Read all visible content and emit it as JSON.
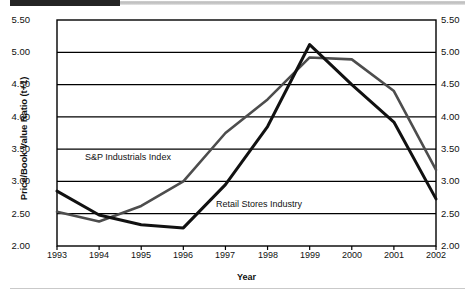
{
  "chart_data": {
    "type": "line",
    "title": "",
    "xlabel": "Year",
    "ylabel": "Price/Book Value Ratio (t+1)",
    "categories": [
      "1993",
      "1994",
      "1995",
      "1996",
      "1997",
      "1998",
      "1999",
      "2000",
      "2001",
      "2002"
    ],
    "x": [
      1993,
      1994,
      1995,
      1996,
      1997,
      1998,
      1999,
      2000,
      2001,
      2002
    ],
    "ylim": [
      2.0,
      5.5
    ],
    "xlim": [
      1993,
      2002
    ],
    "yticks": [
      "2.00",
      "2.50",
      "3.00",
      "3.50",
      "4.00",
      "4.50",
      "5.00",
      "5.50"
    ],
    "ytick_values": [
      2.0,
      2.5,
      3.0,
      3.5,
      4.0,
      4.5,
      5.0,
      5.5
    ],
    "grid": "horizontal",
    "legend_position": "inline-annotation",
    "dual_y_axis": true,
    "series": [
      {
        "name": "S&P Industrials Index",
        "color": "#4d4d4d",
        "values": [
          2.53,
          2.38,
          2.62,
          3.0,
          3.75,
          4.27,
          4.92,
          4.89,
          4.4,
          3.18
        ]
      },
      {
        "name": "Retail Stores Industry",
        "color": "#111111",
        "values": [
          2.85,
          2.48,
          2.33,
          2.28,
          2.95,
          3.85,
          5.12,
          4.5,
          3.92,
          2.73
        ]
      }
    ],
    "annotations": [
      {
        "text": "S&P Industrials Index",
        "series": "S&P Industrials Index"
      },
      {
        "text": "Retail Stores Industry",
        "series": "Retail Stores Industry"
      }
    ]
  },
  "axis": {
    "y_left_ticks": [
      "5.50",
      "5.00",
      "4.50",
      "4.00",
      "3.50",
      "3.00",
      "2.50",
      "2.00"
    ],
    "y_right_ticks": [
      "5.50",
      "5.00",
      "4.50",
      "4.00",
      "3.50",
      "3.00",
      "2.50",
      "2.00"
    ],
    "x_ticks": [
      "1993",
      "1994",
      "1995",
      "1996",
      "1997",
      "1998",
      "1999",
      "2000",
      "2001",
      "2002"
    ],
    "x_title": "Year",
    "y_title": "Price/Book Value Ratio (t+1)"
  },
  "colors": {
    "series_sp": "#4d4d4d",
    "series_retail": "#111111",
    "grid": "#000000",
    "frame": "#000000",
    "background": "#ffffff"
  }
}
